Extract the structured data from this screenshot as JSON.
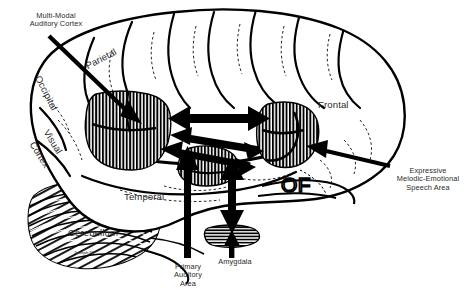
{
  "figure": {
    "type": "anatomical-diagram",
    "style": "black-and-white line drawing with hatched regions and solid arrows",
    "background_color": "#ffffff",
    "ink_color": "#000000"
  },
  "labels": {
    "multi_modal_auditory_cortex": "Multi-Modal\nAuditory Cortex",
    "parietal": "Parietal",
    "occipital": "Occipital",
    "visual_cortex_line1": "Visual",
    "visual_cortex_line2": "Cortex",
    "temporal": "Temporal",
    "cerebellum": "Cerebellum",
    "frontal": "Frontal",
    "orbitofrontal": "OF",
    "primary_auditory_area": "Primary\nAuditory\nArea",
    "amygdala": "Amygdala",
    "expressive_speech_area": "Expressive\nMelodic-Emotional\nSpeech Area",
    "artist_signature": "Joseph 92"
  },
  "regions": [
    {
      "name": "multi-modal-auditory-cortex-patch",
      "hatch": "vertical",
      "note": "large hatched patch, posterior superior temporal / inferior parietal"
    },
    {
      "name": "expressive-speech-area-patch",
      "hatch": "vertical",
      "note": "hatched patch in inferior frontal gyrus (Broca's area)"
    },
    {
      "name": "primary-auditory-area-patch",
      "hatch": "vertical",
      "note": "hatched patch on superior temporal plane"
    },
    {
      "name": "amygdala-patch",
      "hatch": "horizontal",
      "note": "small horizontally hatched almond region in the temporal lobe"
    }
  ],
  "arrows": [
    {
      "name": "arrow-multi-modal-auditory-cortex",
      "kind": "pointer",
      "heads": 1,
      "from": "Multi-Modal Auditory Cortex label",
      "to": "hatched posterior temporal patch"
    },
    {
      "name": "arrow-expressive-speech-area",
      "kind": "pointer",
      "heads": 1,
      "from": "Expressive Melodic-Emotional Speech Area label",
      "to": "hatched inferior frontal patch"
    },
    {
      "name": "arrow-bidirectional-upper",
      "kind": "connection",
      "heads": 2,
      "from": "multi-modal auditory cortex",
      "to": "expressive speech area"
    },
    {
      "name": "arrow-bidirectional-lower",
      "kind": "connection",
      "heads": 2,
      "from": "multi-modal auditory cortex",
      "to": "primary auditory / amygdala complex"
    },
    {
      "name": "arrow-primary-auditory-area",
      "kind": "pointer",
      "heads": 1,
      "from": "Primary Auditory Area label",
      "to": "superior temporal plane patch"
    },
    {
      "name": "arrow-amygdala",
      "kind": "pointer",
      "heads": 1,
      "from": "Amygdala label",
      "to": "amygdala patch"
    },
    {
      "name": "arrow-amygdala-vertical",
      "kind": "connection",
      "heads": 2,
      "from": "auditory cortex",
      "to": "amygdala"
    }
  ]
}
